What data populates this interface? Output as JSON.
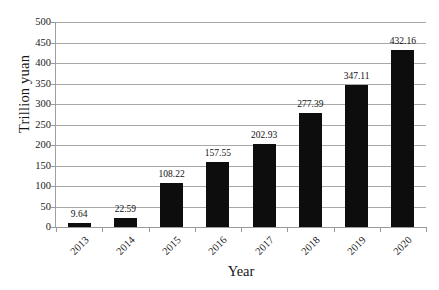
{
  "chart_data": {
    "type": "bar",
    "title": "",
    "xlabel": "Year",
    "ylabel": "Trillion yuan",
    "categories": [
      "2013",
      "2014",
      "2015",
      "2016",
      "2017",
      "2018",
      "2019",
      "2020"
    ],
    "values": [
      9.64,
      22.59,
      108.22,
      157.55,
      202.93,
      277.39,
      347.11,
      432.16
    ],
    "value_labels": [
      "9.64",
      "22.59",
      "108.22",
      "157.55",
      "202.93",
      "277.39",
      "347.11",
      "432.16"
    ],
    "ylim": [
      0,
      500
    ],
    "ytick_step": 50,
    "ytick_labels": [
      "500",
      "450",
      "400",
      "350",
      "300",
      "250",
      "200",
      "150",
      "100",
      "50",
      "0"
    ],
    "grid": true,
    "grid_axis": "y",
    "legend": false,
    "legend_position": "none",
    "bar_color": "#0d0d0d",
    "grid_color": "#a8a8a8",
    "axis_color": "#9a9a9a",
    "text_color": "#1a1a1a"
  }
}
